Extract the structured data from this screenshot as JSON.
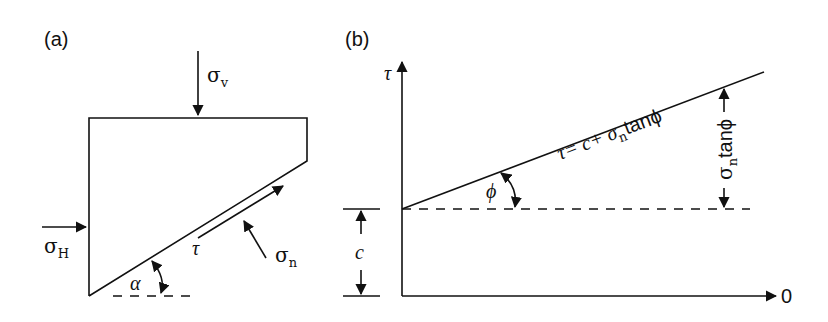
{
  "panel_a": {
    "label": "(a)",
    "sigma_v": {
      "symbol": "σ",
      "sub": "v"
    },
    "sigma_h": {
      "symbol": "σ",
      "sub": "H"
    },
    "sigma_n": {
      "symbol": "σ",
      "sub": "n"
    },
    "tau": "τ",
    "alpha": "α"
  },
  "panel_b": {
    "label": "(b)",
    "y_axis_label": "τ",
    "x_axis_label": "0",
    "cohesion_label": "c",
    "phi_label": "ϕ",
    "equation": {
      "lhs": "τ= c+ σ",
      "sub": "n",
      "rhs": "tanϕ"
    },
    "rise_label": {
      "symbol": "σ",
      "sub": "n",
      "rest": "tanϕ"
    }
  }
}
